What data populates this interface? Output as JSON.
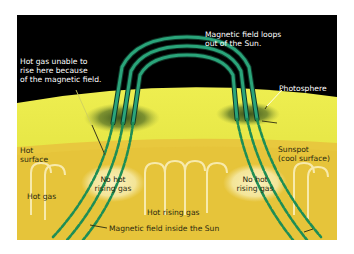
{
  "diagram": {
    "colors": {
      "space": "#000000",
      "photosphere": "#e4e23a",
      "interior": "#e7c43a",
      "field_lines": "#1f9a68",
      "sunspot": "#3c5a22",
      "label_dark": "#2a2a10",
      "label_light": "#ffffff"
    },
    "labels": {
      "hot_gas_blocked_1": "Hot gas unable to",
      "hot_gas_blocked_2": "rise here because",
      "hot_gas_blocked_3": "of the magnetic field.",
      "loops_1": "Magnetic field loops",
      "loops_2": "out of the Sun.",
      "photosphere": "Photosphere",
      "hot_surface_1": "Hot",
      "hot_surface_2": "surface",
      "sunspot_1": "Sunspot",
      "sunspot_2": "(cool surface)",
      "no_hot_left_1": "No hot",
      "no_hot_left_2": "rising gas",
      "no_hot_right_1": "No hot",
      "no_hot_right_2": "rising gas",
      "hot_gas": "Hot gas",
      "hot_rising_gas": "Hot rising gas",
      "field_inside": "Magnetic field inside the Sun"
    }
  }
}
